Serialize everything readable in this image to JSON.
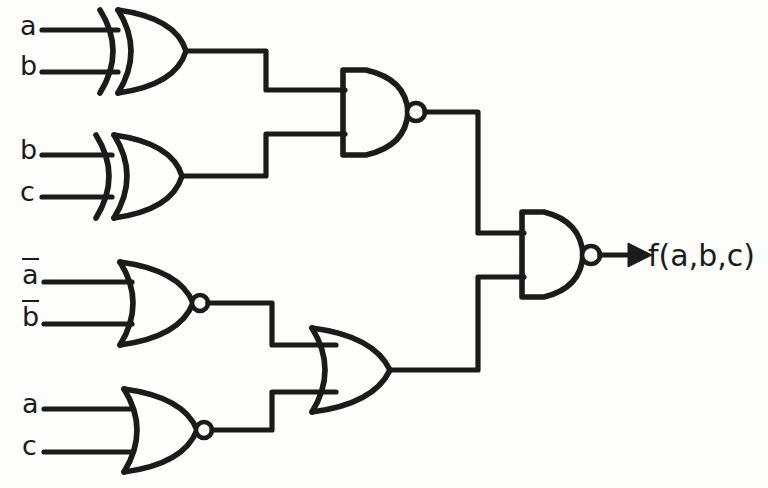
{
  "diagram": {
    "background_color": "#fdfdfb",
    "ink_color": "#1b1b1b"
  },
  "inputs": [
    {
      "id": "in-a-1",
      "label": "a",
      "overbar": false,
      "x": 20,
      "y": 12,
      "wire_y": 30
    },
    {
      "id": "in-b-1",
      "label": "b",
      "overbar": false,
      "x": 20,
      "y": 52,
      "wire_y": 72
    },
    {
      "id": "in-b-2",
      "label": "b",
      "overbar": false,
      "x": 20,
      "y": 136,
      "wire_y": 155
    },
    {
      "id": "in-c-1",
      "label": "c",
      "overbar": false,
      "x": 20,
      "y": 178,
      "wire_y": 197
    },
    {
      "id": "in-abar",
      "label": "a",
      "overbar": true,
      "x": 20,
      "y": 258,
      "wire_y": 282
    },
    {
      "id": "in-bbar",
      "label": "b",
      "overbar": true,
      "x": 20,
      "y": 300,
      "wire_y": 324
    },
    {
      "id": "in-a-2",
      "label": "a",
      "overbar": false,
      "x": 20,
      "y": 390,
      "wire_y": 409
    },
    {
      "id": "in-c-2",
      "label": "c",
      "overbar": false,
      "x": 20,
      "y": 432,
      "wire_y": 452
    }
  ],
  "gates": [
    {
      "id": "xor-1",
      "type": "XOR",
      "name": "xor-gate-top",
      "inputs": [
        "a",
        "b"
      ],
      "output_y": 51
    },
    {
      "id": "xor-2",
      "type": "XOR",
      "name": "xor-gate-second",
      "inputs": [
        "b",
        "c"
      ],
      "output_y": 176
    },
    {
      "id": "nor-1",
      "type": "NOR",
      "name": "nor-gate-third",
      "inputs": [
        "a-bar",
        "b-bar"
      ],
      "output_y": 303
    },
    {
      "id": "nor-2",
      "type": "NOR",
      "name": "nor-gate-bottom",
      "inputs": [
        "a",
        "c"
      ],
      "output_y": 430
    },
    {
      "id": "nand-1",
      "type": "NAND",
      "name": "nand-gate-upper-stage",
      "inputs": [
        "xor-1",
        "xor-2"
      ],
      "output_y": 112
    },
    {
      "id": "or-1",
      "type": "OR",
      "name": "or-gate-lower-stage",
      "inputs": [
        "nor-1",
        "nor-2"
      ],
      "output_y": 370
    },
    {
      "id": "nand-2",
      "type": "NAND",
      "name": "nand-gate-output",
      "inputs": [
        "nand-1",
        "or-1"
      ],
      "output_y": 255
    }
  ],
  "output": {
    "label": "f(a,b,c)",
    "label_x": 648,
    "label_y": 238,
    "arrow_from_x": 600,
    "arrow_to_x": 640,
    "arrow_y": 255
  },
  "function": {
    "expression": "f(a,b,c)",
    "description": "NAND of [ NAND(a XOR b, b XOR c) ] and [ OR(NOR(a-bar,b-bar), NOR(a,c)) ]"
  }
}
